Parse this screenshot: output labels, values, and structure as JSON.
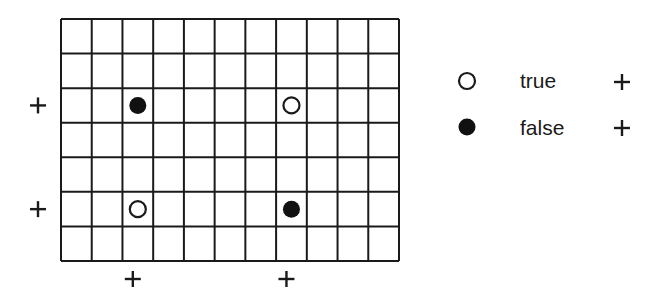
{
  "grid": {
    "cols": 11,
    "rows": 7,
    "x0": 61,
    "y0": 19,
    "x1": 399,
    "y1": 261,
    "line_color": "#1a1a1a"
  },
  "markers": [
    {
      "col": 2,
      "row": 2,
      "type": "filled",
      "meaning": "false"
    },
    {
      "col": 7,
      "row": 2,
      "type": "open",
      "meaning": "true"
    },
    {
      "col": 2,
      "row": 5,
      "type": "open",
      "meaning": "true"
    },
    {
      "col": 7,
      "row": 5,
      "type": "filled",
      "meaning": "false"
    }
  ],
  "row_plus_marks": [
    2,
    5
  ],
  "col_plus_marks": [
    2,
    7
  ],
  "plus_symbol": "+",
  "legend": {
    "items": [
      {
        "symbol": "open",
        "label": "true",
        "sign": "+"
      },
      {
        "symbol": "filled",
        "label": "false",
        "sign": "+"
      }
    ]
  }
}
